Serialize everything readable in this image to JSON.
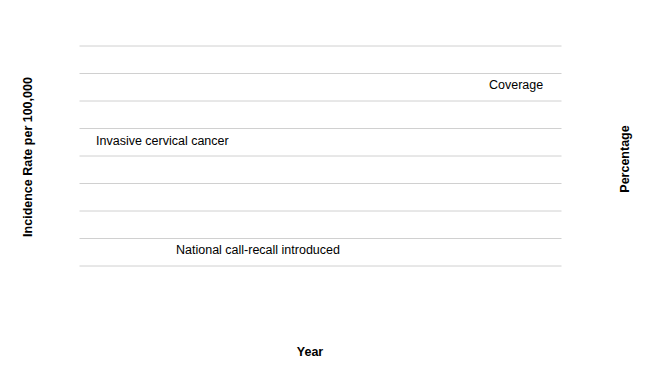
{
  "chart_data": {
    "type": "line",
    "title": "",
    "xlabel": "Year",
    "ylabel_left": "Incidence Rate per 100,000",
    "ylabel_right": "Percentage",
    "x": [
      1971,
      1972,
      1973,
      1974,
      1975,
      1976,
      1977,
      1978,
      1979,
      1980,
      1981,
      1982,
      1983,
      1984,
      1985,
      1986,
      1987,
      1988,
      1989,
      1990,
      1991,
      1992,
      1993,
      1994,
      1995
    ],
    "xlim": [
      1970.5,
      1995.5
    ],
    "ylim_left": [
      9.5,
      18
    ],
    "ylim_right": [
      0,
      100
    ],
    "left_ticks": [
      0,
      10,
      12,
      14,
      16,
      18
    ],
    "left_gridlines": [
      11,
      13,
      15,
      17
    ],
    "left_axis_break": true,
    "right_ticks": [
      0,
      10,
      20,
      30,
      40,
      50,
      60,
      70,
      80,
      90,
      100
    ],
    "right_gridlines": [
      10,
      20,
      30,
      40,
      50,
      60,
      70,
      80,
      90
    ],
    "x_tick_labels": [
      {
        "year": 1971,
        "label": "1971"
      },
      {
        "year": 1975,
        "label": "1975"
      },
      {
        "year": 1980,
        "label": "1980"
      },
      {
        "year": 1985,
        "label": "1985"
      },
      {
        "year": 1987,
        "label": "1987"
      },
      {
        "year": 1990,
        "label": "1990"
      },
      {
        "year": 1995,
        "label": "1995"
      }
    ],
    "grid": true,
    "legend_position": "inline-labels",
    "series": [
      {
        "name": "Invasive cervical cancer",
        "axis": "left",
        "color": "#595959",
        "x": [
          1971,
          1972,
          1973,
          1974,
          1975,
          1976,
          1977,
          1978,
          1979,
          1980,
          1981,
          1982,
          1983,
          1984,
          1985,
          1986,
          1987,
          1988,
          1989,
          1990,
          1991,
          1992,
          1993,
          1994,
          1995
        ],
        "values": [
          15.6,
          14.8,
          15.0,
          14.8,
          14.6,
          14.4,
          14.35,
          13.85,
          14.5,
          15.15,
          15.2,
          15.15,
          14.8,
          15.7,
          16.25,
          15.8,
          16.0,
          15.6,
          14.7,
          15.2,
          13.0,
          12.6,
          11.9,
          11.1,
          10.35
        ]
      },
      {
        "name": "Coverage",
        "axis": "right",
        "color": "#b3b3b3",
        "x": [
          1988,
          1989,
          1990,
          1991,
          1992,
          1993,
          1994,
          1995
        ],
        "values": [
          43,
          57,
          70,
          78,
          83,
          86,
          85,
          85.5
        ]
      }
    ],
    "error_bars": [
      {
        "series": "Invasive cervical cancer",
        "year": 1980,
        "value": 15.15,
        "low": 14.6,
        "high": 15.72
      },
      {
        "series": "Invasive cervical cancer",
        "year": 1995,
        "value": 10.35,
        "low": 9.95,
        "high": 10.95
      }
    ],
    "annotations": [
      {
        "name": "call-recall-annotation",
        "text": "National call-recall introduced",
        "year": 1987,
        "kind": "arrow-to-vline"
      },
      {
        "name": "coverage-label",
        "text": "Coverage"
      },
      {
        "name": "incidence-label",
        "text": "Invasive cervical cancer"
      }
    ],
    "vertical_line": {
      "year": 1987,
      "style": "dashed",
      "color": "#000000"
    }
  },
  "axes": {
    "left_title": "Incidence Rate per 100,000",
    "right_title": "Percentage",
    "x_title": "Year"
  }
}
